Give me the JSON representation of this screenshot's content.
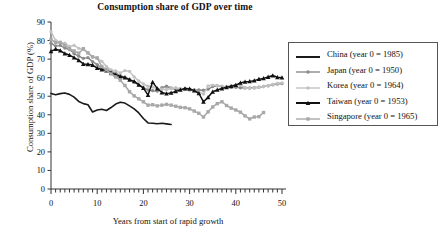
{
  "chart_data": {
    "type": "line",
    "title": "Consumption share of GDP over time",
    "xlabel": "Years from start of rapid growth",
    "ylabel": "Consumption share of GDP (%)",
    "xlim": [
      0,
      50
    ],
    "ylim": [
      0,
      90
    ],
    "xticks": [
      0,
      10,
      20,
      30,
      40,
      50
    ],
    "yticks": [
      0,
      10,
      20,
      30,
      40,
      50,
      60,
      70,
      80,
      90
    ],
    "x_minor_tick_step": 1,
    "grid": false,
    "legend_position": "right-outside",
    "series": [
      {
        "name": "China (year 0 = 1985)",
        "short_name": "China",
        "year_zero": 1985,
        "color": "#1a1a1a",
        "marker": "none",
        "line_width": 1.6,
        "x": [
          0,
          1,
          2,
          3,
          4,
          5,
          6,
          7,
          8,
          9,
          10,
          11,
          12,
          13,
          14,
          15,
          16,
          17,
          18,
          19,
          20,
          21,
          22,
          23,
          24,
          25,
          26
        ],
        "values": [
          51.5,
          50.8,
          51.4,
          51.7,
          51.0,
          49.5,
          47.2,
          46.0,
          45.4,
          41.5,
          42.6,
          43.0,
          42.3,
          43.9,
          45.8,
          46.8,
          46.3,
          44.8,
          43.2,
          41.0,
          38.0,
          35.6,
          35.4,
          35.2,
          35.4,
          35.1,
          34.8
        ]
      },
      {
        "name": "Japan (year 0 = 1950)",
        "short_name": "Japan",
        "year_zero": 1950,
        "color": "#8a8a8a",
        "marker": "circle",
        "line_width": 1.5,
        "x": [
          0,
          1,
          2,
          3,
          4,
          5,
          6,
          7,
          8,
          9,
          10,
          11,
          12,
          13,
          14,
          15,
          16,
          17,
          18,
          19,
          20,
          21,
          22,
          23,
          24,
          25,
          26,
          27,
          28,
          29,
          30,
          31,
          32,
          33,
          34,
          35,
          36,
          37,
          38,
          39,
          40,
          41,
          42,
          43,
          44,
          45,
          46,
          47,
          48,
          49,
          50
        ],
        "values": [
          78.5,
          77.0,
          77.4,
          76.0,
          75.2,
          73.0,
          71.6,
          70.4,
          70.8,
          68.6,
          67.0,
          65.0,
          64.6,
          63.2,
          62.4,
          61.0,
          60.2,
          59.2,
          57.6,
          56.0,
          54.6,
          53.4,
          53.0,
          52.8,
          54.6,
          55.4,
          54.4,
          53.6,
          53.8,
          54.0,
          53.6,
          53.4,
          53.4,
          53.2,
          53.8,
          55.2,
          55.6,
          55.2,
          55.0,
          55.0,
          54.8,
          54.6,
          54.4,
          54.4,
          54.6,
          54.8,
          55.2,
          55.6,
          56.2,
          56.6,
          56.8
        ]
      },
      {
        "name": "Korea (year 0 = 1964)",
        "short_name": "Korea",
        "year_zero": 1964,
        "color": "#c2c2c2",
        "marker": "circle",
        "line_width": 1.5,
        "x": [
          0,
          1,
          2,
          3,
          4,
          5,
          6,
          7,
          8,
          9,
          10,
          11,
          12,
          13,
          14,
          15,
          16,
          17,
          18,
          19,
          20,
          21,
          22,
          23,
          24,
          25,
          26,
          27,
          28,
          29,
          30,
          31,
          32,
          33,
          34,
          35,
          36,
          37,
          38,
          39,
          40,
          41,
          42,
          43,
          44,
          45,
          46,
          47,
          48,
          49,
          50
        ],
        "values": [
          84.8,
          80.0,
          79.0,
          78.6,
          76.8,
          77.4,
          75.8,
          75.2,
          73.2,
          71.2,
          70.6,
          68.8,
          66.0,
          64.2,
          63.6,
          62.6,
          63.8,
          63.4,
          60.4,
          58.2,
          56.6,
          55.4,
          55.0,
          54.0,
          53.8,
          53.6,
          54.2,
          54.6,
          54.0,
          53.6,
          53.2,
          53.0,
          52.2,
          51.2,
          55.6,
          56.0,
          55.8,
          55.4,
          55.2,
          55.6,
          56.0,
          56.2,
          54.6,
          54.2,
          54.4,
          54.8,
          55.2,
          55.6,
          56.4,
          57.0,
          57.2
        ]
      },
      {
        "name": "Taiwan (year 0 = 1953)",
        "short_name": "Taiwan",
        "year_zero": 1953,
        "color": "#111111",
        "marker": "triangle",
        "line_width": 1.5,
        "x": [
          0,
          1,
          2,
          3,
          4,
          5,
          6,
          7,
          8,
          9,
          10,
          11,
          12,
          13,
          14,
          15,
          16,
          17,
          18,
          19,
          20,
          21,
          22,
          23,
          24,
          25,
          26,
          27,
          28,
          29,
          30,
          31,
          32,
          33,
          34,
          35,
          36,
          37,
          38,
          39,
          40,
          41,
          42,
          43,
          44,
          45,
          46,
          47,
          48,
          49,
          50
        ],
        "values": [
          74.2,
          75.4,
          74.6,
          73.0,
          72.2,
          70.8,
          69.4,
          67.4,
          67.2,
          66.8,
          65.2,
          64.4,
          63.8,
          62.6,
          61.6,
          60.6,
          60.0,
          58.8,
          58.0,
          56.2,
          54.4,
          50.6,
          57.6,
          54.2,
          52.0,
          51.4,
          51.8,
          52.6,
          53.4,
          54.2,
          54.0,
          53.0,
          51.6,
          47.0,
          49.4,
          52.4,
          53.4,
          54.2,
          54.8,
          55.4,
          56.0,
          57.2,
          57.8,
          58.0,
          58.4,
          59.2,
          59.6,
          60.4,
          61.2,
          60.2,
          60.0
        ]
      },
      {
        "name": "Singapore (year 0 = 1965)",
        "short_name": "Singapore",
        "year_zero": 1965,
        "color": "#a8a8a8",
        "marker": "square",
        "line_width": 1.5,
        "x": [
          0,
          1,
          2,
          3,
          4,
          5,
          6,
          7,
          8,
          9,
          10,
          11,
          12,
          13,
          14,
          15,
          16,
          17,
          18,
          19,
          20,
          21,
          22,
          23,
          24,
          25,
          26,
          27,
          28,
          29,
          30,
          31,
          32,
          33,
          34,
          35,
          36,
          37,
          38,
          39,
          40,
          41,
          42,
          43,
          44,
          45,
          46
        ],
        "values": [
          80.6,
          78.8,
          79.0,
          77.4,
          75.6,
          74.4,
          73.2,
          75.6,
          73.4,
          71.2,
          70.6,
          66.0,
          64.2,
          62.0,
          60.4,
          58.6,
          55.8,
          52.4,
          50.2,
          48.6,
          47.0,
          45.2,
          45.4,
          44.8,
          45.2,
          45.6,
          45.2,
          44.6,
          44.0,
          43.8,
          43.2,
          42.0,
          40.8,
          38.8,
          41.6,
          44.2,
          46.0,
          47.0,
          45.0,
          43.6,
          42.6,
          41.4,
          39.4,
          37.8,
          38.8,
          39.0,
          41.2
        ]
      }
    ]
  },
  "legend": {
    "items": [
      {
        "label": "China (year 0 = 1985)",
        "key": "line-plain",
        "color": "#1a1a1a"
      },
      {
        "label": "Japan (year 0 = 1950)",
        "key": "line-circle",
        "color": "#8a8a8a"
      },
      {
        "label": "Korea (year 0 = 1964)",
        "key": "line-circle",
        "color": "#c2c2c2"
      },
      {
        "label": "Taiwan (year 0 = 1953)",
        "key": "line-triangle",
        "color": "#111111"
      },
      {
        "label": "Singapore (year 0 = 1965)",
        "key": "line-square",
        "color": "#a8a8a8"
      }
    ]
  }
}
